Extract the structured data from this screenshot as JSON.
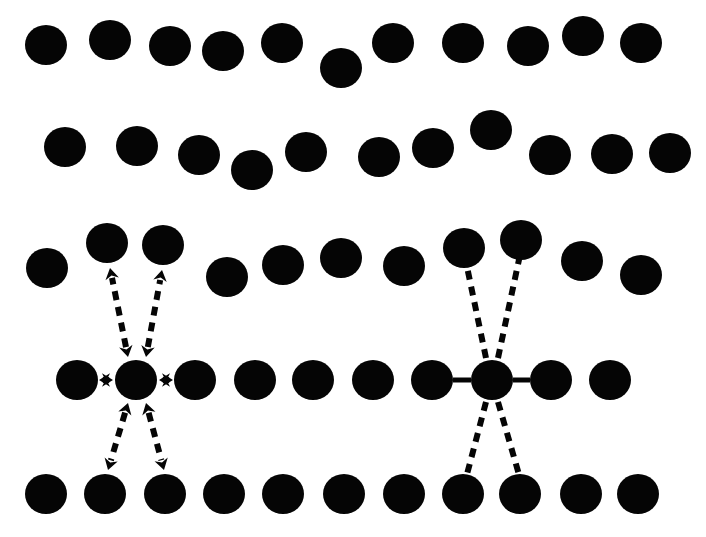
{
  "figure": {
    "title": "",
    "width": 706,
    "height": 537,
    "background_color": "#ffffff",
    "particle_color": "#050505",
    "line_color": "#050505"
  },
  "geometry": {
    "dot_radius_x": 21,
    "dot_radius_y": 20,
    "dash_pattern": "9 7",
    "dash_width": 6,
    "solid_width": 6,
    "bond_width": 5,
    "arrow_head_size": 11
  },
  "rows": [
    {
      "name": "row-1-top-disordered",
      "ordered": false,
      "dots": [
        {
          "cx": 46,
          "cy": 45
        },
        {
          "cx": 110,
          "cy": 40
        },
        {
          "cx": 170,
          "cy": 46
        },
        {
          "cx": 223,
          "cy": 51
        },
        {
          "cx": 282,
          "cy": 43
        },
        {
          "cx": 341,
          "cy": 68
        },
        {
          "cx": 393,
          "cy": 43
        },
        {
          "cx": 463,
          "cy": 43
        },
        {
          "cx": 528,
          "cy": 46
        },
        {
          "cx": 583,
          "cy": 36
        },
        {
          "cx": 641,
          "cy": 43
        }
      ]
    },
    {
      "name": "row-2-disordered",
      "ordered": false,
      "dots": [
        {
          "cx": 65,
          "cy": 147
        },
        {
          "cx": 137,
          "cy": 146
        },
        {
          "cx": 199,
          "cy": 155
        },
        {
          "cx": 252,
          "cy": 170
        },
        {
          "cx": 306,
          "cy": 152
        },
        {
          "cx": 379,
          "cy": 157
        },
        {
          "cx": 433,
          "cy": 148
        },
        {
          "cx": 491,
          "cy": 130
        },
        {
          "cx": 550,
          "cy": 155
        },
        {
          "cx": 612,
          "cy": 154
        },
        {
          "cx": 670,
          "cy": 153
        }
      ]
    },
    {
      "name": "row-3-upper-neighbours",
      "ordered": false,
      "dots": [
        {
          "cx": 47,
          "cy": 268
        },
        {
          "cx": 107,
          "cy": 243
        },
        {
          "cx": 163,
          "cy": 245
        },
        {
          "cx": 227,
          "cy": 277
        },
        {
          "cx": 283,
          "cy": 265
        },
        {
          "cx": 341,
          "cy": 258
        },
        {
          "cx": 404,
          "cy": 266
        },
        {
          "cx": 464,
          "cy": 248
        },
        {
          "cx": 521,
          "cy": 240
        },
        {
          "cx": 582,
          "cy": 261
        },
        {
          "cx": 641,
          "cy": 275
        }
      ]
    },
    {
      "name": "row-4-central",
      "ordered": true,
      "dots": [
        {
          "cx": 77,
          "cy": 380
        },
        {
          "cx": 136,
          "cy": 380
        },
        {
          "cx": 195,
          "cy": 380
        },
        {
          "cx": 255,
          "cy": 380
        },
        {
          "cx": 313,
          "cy": 380
        },
        {
          "cx": 373,
          "cy": 380
        },
        {
          "cx": 432,
          "cy": 380
        },
        {
          "cx": 492,
          "cy": 380
        },
        {
          "cx": 551,
          "cy": 380
        },
        {
          "cx": 610,
          "cy": 380
        }
      ]
    },
    {
      "name": "row-5-bottom",
      "ordered": true,
      "dots": [
        {
          "cx": 46,
          "cy": 494
        },
        {
          "cx": 105,
          "cy": 494
        },
        {
          "cx": 165,
          "cy": 494
        },
        {
          "cx": 224,
          "cy": 494
        },
        {
          "cx": 283,
          "cy": 494
        },
        {
          "cx": 344,
          "cy": 494
        },
        {
          "cx": 404,
          "cy": 494
        },
        {
          "cx": 463,
          "cy": 494
        },
        {
          "cx": 520,
          "cy": 494
        },
        {
          "cx": 581,
          "cy": 494
        },
        {
          "cx": 638,
          "cy": 494
        }
      ]
    }
  ],
  "left_cluster": {
    "name": "vibration-cluster",
    "center": {
      "cx": 136,
      "cy": 380
    },
    "horizontal_arrows": [
      {
        "name": "arrow-left",
        "x1": 113,
        "y1": 380,
        "x2": 99,
        "y2": 380,
        "style": "solid",
        "double_headed": true
      },
      {
        "name": "arrow-right",
        "x1": 159,
        "y1": 380,
        "x2": 173,
        "y2": 380,
        "style": "solid",
        "double_headed": true
      }
    ],
    "diagonal_arrows": [
      {
        "name": "arrow-upper-left",
        "x1": 128,
        "y1": 357,
        "x2": 110,
        "y2": 268,
        "style": "dashed",
        "double_headed": true
      },
      {
        "name": "arrow-upper-right",
        "x1": 146,
        "y1": 357,
        "x2": 162,
        "y2": 270,
        "style": "dashed",
        "double_headed": true
      },
      {
        "name": "arrow-lower-left",
        "x1": 128,
        "y1": 403,
        "x2": 108,
        "y2": 470,
        "style": "dashed",
        "double_headed": true
      },
      {
        "name": "arrow-lower-right",
        "x1": 146,
        "y1": 403,
        "x2": 164,
        "y2": 470,
        "style": "dashed",
        "double_headed": true
      }
    ]
  },
  "right_cluster": {
    "name": "bond-cluster",
    "center": {
      "cx": 492,
      "cy": 380
    },
    "solid_bonds": [
      {
        "name": "bond-left",
        "x1": 471,
        "y1": 380,
        "x2": 453,
        "y2": 380,
        "style": "solid"
      },
      {
        "name": "bond-right",
        "x1": 513,
        "y1": 380,
        "x2": 530,
        "y2": 380,
        "style": "solid"
      }
    ],
    "dashed_bonds": [
      {
        "name": "bond-upper-left",
        "x1": 486,
        "y1": 358,
        "x2": 466,
        "y2": 262,
        "style": "dashed"
      },
      {
        "name": "bond-upper-right",
        "x1": 498,
        "y1": 358,
        "x2": 520,
        "y2": 255,
        "style": "dashed"
      },
      {
        "name": "bond-lower-left",
        "x1": 486,
        "y1": 402,
        "x2": 466,
        "y2": 478,
        "style": "dashed"
      },
      {
        "name": "bond-lower-right",
        "x1": 498,
        "y1": 402,
        "x2": 520,
        "y2": 478,
        "style": "dashed"
      }
    ]
  }
}
